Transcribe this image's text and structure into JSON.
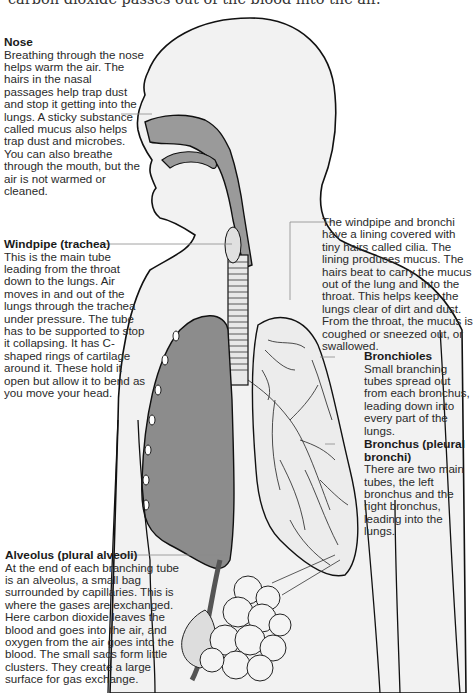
{
  "intro_text": "carbon dioxide passes out of the blood into the air.",
  "colors": {
    "body_fill": "#f2f2f2",
    "airway_fill": "#9a9a9a",
    "lung_fill": "#8c8c8c",
    "outline": "#111111",
    "leader_line": "#888888",
    "text": "#2a2a2a"
  },
  "labels": {
    "nose": {
      "title": "Nose",
      "text": "Breathing through the nose helps warm the air. The hairs in the nasal passages help trap dust and stop it getting into the lungs. A sticky substance called mucus also helps trap dust and microbes. You can also breathe through the mouth, but the air is not warmed or cleaned."
    },
    "windpipe": {
      "title": "Windpipe (trachea)",
      "text": "This is the main tube leading from the throat down to the lungs. Air moves in and out of the lungs through the trachea under pressure. The tube has to be supported to stop it collapsing. It has C-shaped rings of cartilage around it. These hold it open but allow it to bend as you move your head."
    },
    "cilia": {
      "title": "",
      "text": "The windpipe and bronchi have a lining covered with tiny hairs called cilia. The lining produces mucus. The hairs beat to carry the mucus out of the lung and into the throat. This helps keep the lungs clear of dirt and dust. From the throat, the mucus is coughed or sneezed out, or swallowed."
    },
    "bronchioles": {
      "title": "Bronchioles",
      "text": "Small branching tubes spread out from each bronchus, leading down into every part of the lungs."
    },
    "bronchus": {
      "title": "Bronchus (pleural bronchi)",
      "text": "There are two main tubes, the left bronchus and the right bronchus, leading into the lungs."
    },
    "alveolus": {
      "title": "Alveolus (plural alveoli)",
      "text": "At the end of each branching tube is an alveolus, a small bag surrounded by capillaries. This is where the gases are exchanged. Here carbon dioxide leaves the blood and goes into the air, and oxygen from the air goes into the blood. The small sacs form little clusters. They create a large surface for gas exchange."
    }
  }
}
